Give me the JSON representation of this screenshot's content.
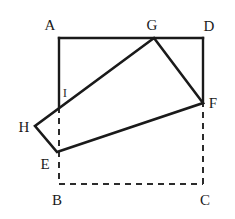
{
  "figure": {
    "stroke_color": "#1a1a1a",
    "dashed_color": "#2b2b2b",
    "background_color": "#ffffff",
    "solid_stroke_width": 2.4,
    "dashed_stroke_width": 2.0,
    "dash_pattern": "6,5"
  },
  "points": {
    "A": {
      "label": "A",
      "x": 59,
      "y": 38,
      "label_x": 50,
      "label_y": 25
    },
    "B": {
      "label": "B",
      "x": 59,
      "y": 184,
      "label_x": 57,
      "label_y": 200
    },
    "C": {
      "label": "C",
      "x": 203,
      "y": 184,
      "label_x": 205,
      "label_y": 200
    },
    "D": {
      "label": "D",
      "x": 203,
      "y": 38,
      "label_x": 209,
      "label_y": 26
    },
    "E": {
      "label": "E",
      "x": 57,
      "y": 152,
      "label_x": 45,
      "label_y": 164
    },
    "F": {
      "label": "F",
      "x": 203,
      "y": 103,
      "label_x": 213,
      "label_y": 103
    },
    "G": {
      "label": "G",
      "x": 154,
      "y": 38,
      "label_x": 152,
      "label_y": 25
    },
    "H": {
      "label": "H",
      "x": 35,
      "y": 126,
      "label_x": 24,
      "label_y": 127
    },
    "I": {
      "label": "I",
      "x": 59,
      "y": 107,
      "label_x": 65,
      "label_y": 92
    }
  },
  "shapes": {
    "rectangle_abcd": {
      "name": "ABCD",
      "vertices": [
        "A",
        "B",
        "C",
        "D"
      ],
      "solid_edges": [
        [
          "A",
          "D"
        ],
        [
          "A",
          "I"
        ],
        [
          "D",
          "F"
        ]
      ],
      "dashed_edges": [
        [
          "I",
          "B"
        ],
        [
          "B",
          "C"
        ],
        [
          "C",
          "F"
        ]
      ]
    },
    "rectangle_efgh": {
      "name": "EFGH",
      "vertices": [
        "E",
        "F",
        "G",
        "H"
      ],
      "solid_edges": [
        [
          "E",
          "F"
        ],
        [
          "F",
          "G"
        ],
        [
          "G",
          "H"
        ],
        [
          "H",
          "E"
        ]
      ]
    }
  }
}
